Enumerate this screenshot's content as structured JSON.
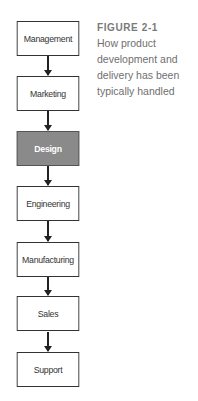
{
  "caption": {
    "figure_label": "FIGURE 2-1",
    "text": "How product development and delivery has been typically handled"
  },
  "flow": {
    "steps": [
      {
        "label": "Management",
        "highlighted": false
      },
      {
        "label": "Marketing",
        "highlighted": false
      },
      {
        "label": "Design",
        "highlighted": true
      },
      {
        "label": "Engineering",
        "highlighted": false
      },
      {
        "label": "Manufacturing",
        "highlighted": false
      },
      {
        "label": "Sales",
        "highlighted": false
      },
      {
        "label": "Support",
        "highlighted": false
      }
    ]
  },
  "colors": {
    "box_border": "#333333",
    "highlight_fill": "#8a8a8a",
    "caption_text": "#6f6f6f"
  }
}
